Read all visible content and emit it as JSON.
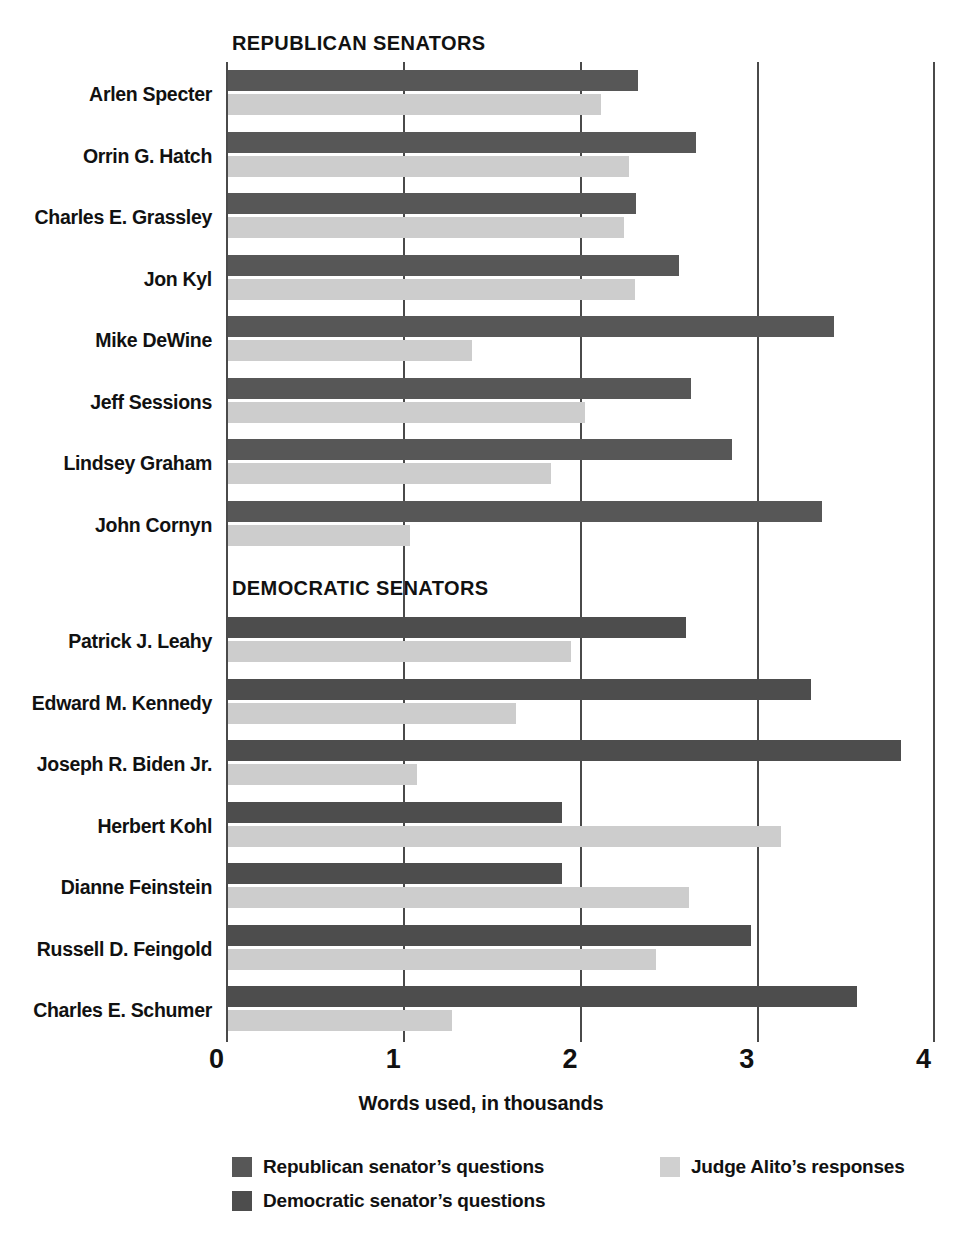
{
  "chart_data": {
    "type": "bar",
    "orientation": "horizontal",
    "title": "",
    "xlabel": "Words used, in thousands",
    "ylabel": "",
    "xlim": [
      0,
      4
    ],
    "xticks": [
      "0",
      "1",
      "2",
      "3",
      "4"
    ],
    "grid": "vertical",
    "legend_position": "bottom",
    "colors": {
      "republican_questions": "#575757",
      "democratic_questions": "#4d4d4d",
      "alito_responses": "#cdcdcd"
    },
    "legend": [
      {
        "label": "Republican senator’s questions",
        "swatch": "rep"
      },
      {
        "label": "Democratic senator’s questions",
        "swatch": "dem"
      },
      {
        "label": "Judge Alito’s responses",
        "swatch": "resp"
      }
    ],
    "groups": [
      {
        "heading": "REPUBLICAN SENATORS",
        "party": "republican",
        "series_names": [
          "Republican senator’s questions",
          "Judge Alito’s responses"
        ],
        "categories": [
          "Arlen Specter",
          "Orrin G. Hatch",
          "Charles E. Grassley",
          "Jon Kyl",
          "Mike DeWine",
          "Jeff Sessions",
          "Lindsey Graham",
          "John Cornyn"
        ],
        "questions": [
          2.32,
          2.65,
          2.31,
          2.55,
          3.43,
          2.62,
          2.85,
          3.36
        ],
        "responses": [
          2.11,
          2.27,
          2.24,
          2.3,
          1.38,
          2.02,
          1.83,
          1.03
        ]
      },
      {
        "heading": "DEMOCRATIC SENATORS",
        "party": "democratic",
        "series_names": [
          "Democratic senator’s questions",
          "Judge Alito’s responses"
        ],
        "categories": [
          "Patrick J. Leahy",
          "Edward M. Kennedy",
          "Joseph R. Biden Jr.",
          "Herbert Kohl",
          "Dianne Feinstein",
          "Russell D. Feingold",
          "Charles E. Schumer"
        ],
        "questions": [
          2.59,
          3.3,
          3.81,
          1.89,
          1.89,
          2.96,
          3.56
        ],
        "responses": [
          1.94,
          1.63,
          1.07,
          3.13,
          2.61,
          2.42,
          1.27
        ]
      }
    ]
  }
}
